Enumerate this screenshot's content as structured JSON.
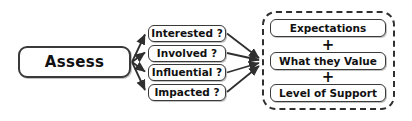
{
  "diagram": {
    "background_color": "#ffffff",
    "stroke_color": "#3a3a3a",
    "text_color": "#111111",
    "source": {
      "label": "Assess"
    },
    "questions": [
      {
        "label": "Interested ?"
      },
      {
        "label": "Involved ?"
      },
      {
        "label": "Influential ?"
      },
      {
        "label": "Impacted ?"
      }
    ],
    "outcome_group": {
      "border_style": "dashed",
      "items": [
        {
          "label": "Expectations"
        },
        {
          "label": "What they Value"
        },
        {
          "label": "Level of Support"
        }
      ],
      "operators": [
        "+",
        "+"
      ]
    }
  }
}
